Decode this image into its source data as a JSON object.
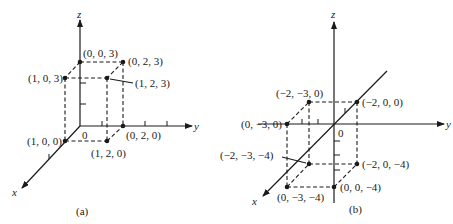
{
  "figure": {
    "panel_a": {
      "caption": "(a)",
      "axes": {
        "x": "x",
        "y": "y",
        "z": "z",
        "origin": "0"
      },
      "points": [
        {
          "label": "(0, 0, 3)"
        },
        {
          "label": "(0, 2, 3)"
        },
        {
          "label": "(1, 0, 3)"
        },
        {
          "label": "(1, 2, 3)"
        },
        {
          "label": "(1, 0, 0)"
        },
        {
          "label": "(1, 2, 0)"
        },
        {
          "label": "(0, 2, 0)"
        }
      ]
    },
    "panel_b": {
      "caption": "(b)",
      "axes": {
        "x": "x",
        "y": "y",
        "z": "z",
        "origin": "0"
      },
      "points": [
        {
          "label": "(0, −3, 0)"
        },
        {
          "label": "(−2, −3, 0)"
        },
        {
          "label": "(−2, 0, 0)"
        },
        {
          "label": "(−2, −3, −4)"
        },
        {
          "label": "(−2, 0, −4)"
        },
        {
          "label": "(0, −3, −4)"
        },
        {
          "label": "(0, 0, −4)"
        }
      ]
    }
  }
}
